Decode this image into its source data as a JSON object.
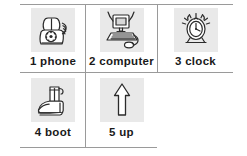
{
  "worksheet": {
    "title": "picture vocabulary grid",
    "rows": 2,
    "columns": 3,
    "line_color": "#9a9a9a",
    "art_background": "#e9e9e9",
    "text_color": "#1a1a1a"
  },
  "items": [
    {
      "number": "1",
      "word": "phone",
      "caption": "1 phone",
      "icon": "telephone-icon"
    },
    {
      "number": "2",
      "word": "computer",
      "caption": "2 computer",
      "icon": "computer-icon"
    },
    {
      "number": "3",
      "word": "clock",
      "caption": "3 clock",
      "icon": "alarm-clock-icon"
    },
    {
      "number": "4",
      "word": "boot",
      "caption": "4 boot",
      "icon": "boot-icon"
    },
    {
      "number": "5",
      "word": "up",
      "caption": "5 up",
      "icon": "up-arrow-icon"
    }
  ]
}
